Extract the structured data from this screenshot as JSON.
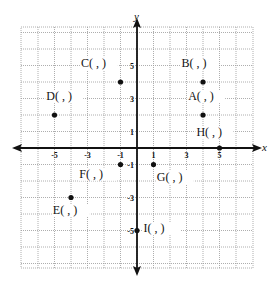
{
  "worksheet": {
    "axes": {
      "x_label": "x",
      "y_label": "y"
    },
    "x_ticks": [
      {
        "value": -5,
        "label": "-5"
      },
      {
        "value": -3,
        "label": "-3"
      },
      {
        "value": -1,
        "label": "-1"
      },
      {
        "value": 1,
        "label": "1"
      },
      {
        "value": 3,
        "label": "3"
      },
      {
        "value": 5,
        "label": "5"
      }
    ],
    "y_ticks": [
      {
        "value": 5,
        "label": "5"
      },
      {
        "value": 3,
        "label": "3"
      },
      {
        "value": 1,
        "label": "1"
      },
      {
        "value": -1,
        "label": "-1"
      },
      {
        "value": -3,
        "label": "-3"
      },
      {
        "value": -5,
        "label": "-5"
      }
    ],
    "points": [
      {
        "name": "A",
        "x": 4,
        "y": 2,
        "label": "A(   ,   )",
        "lx": 3.1,
        "ly": 2.9
      },
      {
        "name": "B",
        "x": 4,
        "y": 4,
        "label": "B(   ,   )",
        "lx": 2.7,
        "ly": 4.9
      },
      {
        "name": "C",
        "x": -1,
        "y": 4,
        "label": "C(   ,   )",
        "lx": -3.4,
        "ly": 4.9
      },
      {
        "name": "D",
        "x": -5,
        "y": 2,
        "label": "D(   ,   )",
        "lx": -5.5,
        "ly": 2.9
      },
      {
        "name": "E",
        "x": -4,
        "y": -3,
        "label": "E(   ,   )",
        "lx": -5.1,
        "ly": -4.0
      },
      {
        "name": "F",
        "x": -1,
        "y": -1,
        "label": "F(   ,   )",
        "lx": -3.5,
        "ly": -1.8
      },
      {
        "name": "G",
        "x": 1,
        "y": -1,
        "label": "G(   ,   )",
        "lx": 1.2,
        "ly": -2.0
      },
      {
        "name": "H",
        "x": 5,
        "y": 0,
        "label": "H(   ,   )",
        "lx": 3.6,
        "ly": 0.7
      },
      {
        "name": "I",
        "x": 0,
        "y": -5,
        "label": "I(   ,   )",
        "lx": 0.4,
        "ly": -5.1
      }
    ]
  }
}
